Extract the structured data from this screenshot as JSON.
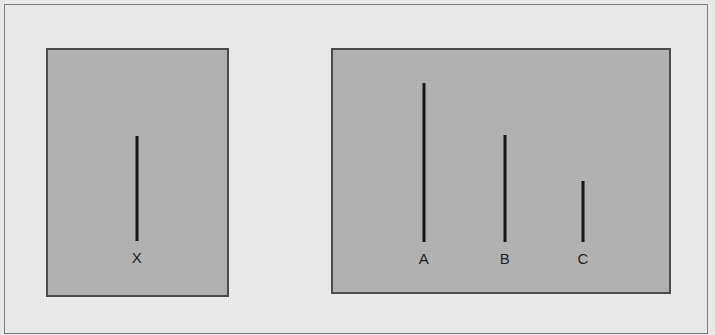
{
  "figure": {
    "name": "line-length-comparison-stimulus",
    "background_color": "#ececec",
    "border_color": "#7d7d7d",
    "panel_fill_color": "#b3b3b3",
    "panel_border_color": "#4a4a4a",
    "line_color": "#141414",
    "label_color": "#1c1c1c"
  },
  "panels": {
    "standard": {
      "label": "standard-line-panel",
      "lines": [
        {
          "id": "x",
          "label": "X",
          "length_px": 105,
          "x_px": 137,
          "top_px": 136,
          "bottom_px": 241
        }
      ]
    },
    "comparison": {
      "label": "comparison-lines-panel",
      "lines": [
        {
          "id": "a",
          "label": "A",
          "length_px": 159,
          "x_px": 424,
          "top_px": 83,
          "bottom_px": 242
        },
        {
          "id": "b",
          "label": "B",
          "length_px": 107,
          "x_px": 505,
          "top_px": 135,
          "bottom_px": 242
        },
        {
          "id": "c",
          "label": "C",
          "length_px": 61,
          "x_px": 583,
          "top_px": 181,
          "bottom_px": 242
        }
      ]
    }
  },
  "chart_data": {
    "type": "bar",
    "title": "",
    "subtitle": "",
    "xlabel": "",
    "ylabel": "",
    "orientation": "vertical",
    "grid": false,
    "legend": null,
    "groups": [
      {
        "name": "standard",
        "categories": [
          "X"
        ],
        "values": [
          105
        ]
      },
      {
        "name": "comparison",
        "categories": [
          "A",
          "B",
          "C"
        ],
        "values": [
          159,
          107,
          61
        ]
      }
    ],
    "categories": [
      "X",
      "A",
      "B",
      "C"
    ],
    "values": [
      105,
      159,
      107,
      61
    ],
    "value_units": "pixels (line length)",
    "ylim": [
      0,
      159
    ],
    "annotations": []
  }
}
